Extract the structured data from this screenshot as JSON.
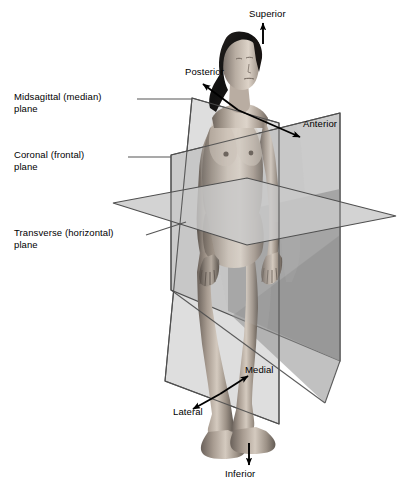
{
  "figure": {
    "background_color": "#ffffff"
  },
  "plane_labels": [
    {
      "id": "midsagittal",
      "text": "Midsagittal (median)\nplane"
    },
    {
      "id": "coronal",
      "text": "Coronal (frontal)\nplane"
    },
    {
      "id": "transverse",
      "text": "Transverse (horizontal)\nplane"
    }
  ],
  "direction_labels": [
    {
      "id": "superior",
      "text": "Superior"
    },
    {
      "id": "posterior",
      "text": "Posterior"
    },
    {
      "id": "anterior",
      "text": "Anterior"
    },
    {
      "id": "medial",
      "text": "Medial"
    },
    {
      "id": "lateral",
      "text": "Lateral"
    },
    {
      "id": "inferior",
      "text": "Inferior"
    }
  ],
  "colors": {
    "plane_fill_light": "#d9d9d9",
    "plane_fill_mid": "#bcbcbc",
    "plane_fill_dark": "#8f8f8f",
    "plane_stroke": "#4a4a4a",
    "leader_line": "#555555",
    "arrow": "#000000",
    "text": "#000000",
    "skin_light": "#d8cfc6",
    "skin_mid": "#a89c91",
    "skin_shadow": "#6e655d",
    "hair": "#151515"
  }
}
